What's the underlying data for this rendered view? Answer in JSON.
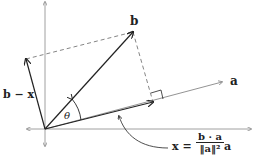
{
  "labels": {
    "b": "b",
    "a": "a",
    "b_minus_x": "b − x",
    "theta": "θ",
    "x_eq": "x =",
    "numerator": "b · a",
    "denominator": "‖a‖²",
    "trailing": "a"
  },
  "colors": {
    "vector": "#222222",
    "axis": "#888888",
    "dashed": "#666666",
    "a_line": "#777777"
  }
}
